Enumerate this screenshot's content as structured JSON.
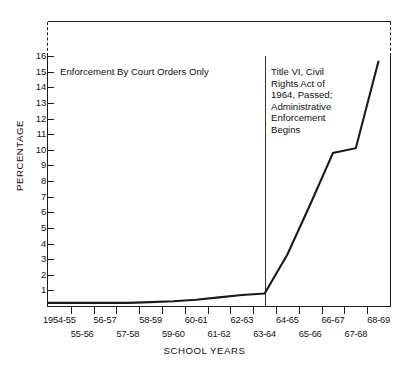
{
  "chart_data": {
    "type": "line",
    "title": "",
    "xlabel": "SCHOOL YEARS",
    "ylabel": "PERCENTAGE",
    "ylim": [
      0,
      16
    ],
    "yticks": [
      1,
      2,
      3,
      4,
      5,
      6,
      7,
      8,
      9,
      10,
      11,
      12,
      13,
      14,
      15,
      16
    ],
    "grid": false,
    "legend": null,
    "categories": [
      "1954-55",
      "55-56",
      "56-57",
      "57-58",
      "58-59",
      "59-60",
      "60-61",
      "61-62",
      "62-63",
      "63-64",
      "64-65",
      "65-66",
      "66-67",
      "67-68",
      "68-69"
    ],
    "x_labels_row_top": [
      "1954-55",
      "56-57",
      "58-59",
      "60-61",
      "62-63",
      "64-65",
      "66-67",
      "68-69"
    ],
    "x_labels_row_bottom": [
      "55-56",
      "57-58",
      "59-60",
      "61-62",
      "63-64",
      "65-66",
      "67-68"
    ],
    "series": [
      {
        "name": "Percentage of Negro students in desegregated schools",
        "values": [
          0.2,
          0.2,
          0.2,
          0.2,
          0.25,
          0.3,
          0.4,
          0.55,
          0.7,
          0.8,
          3.3,
          6.5,
          9.8,
          10.1,
          15.7
        ]
      }
    ],
    "annotations": [
      {
        "id": "enforcement-court-orders",
        "text": "Enforcement By Court Orders Only",
        "lines": [
          "Enforcement By Court Orders Only"
        ]
      },
      {
        "id": "title-vi-civil-rights",
        "lines": [
          "Title VI, Civil",
          "Rights Act of",
          "1964, Passed;",
          "Administrative",
          "Enforcement",
          "Begins"
        ]
      }
    ],
    "event_divider": {
      "at_category": "63-64/64-65",
      "label": "Title VI, Civil Rights Act of 1964"
    },
    "colors": {
      "line": "#1a1a1a",
      "axis": "#1a1a1a",
      "text": "#111111",
      "background": "#ffffff",
      "divider": "#333333"
    }
  }
}
